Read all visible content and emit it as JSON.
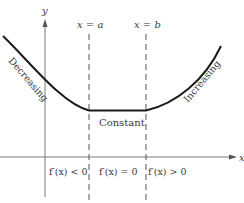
{
  "diagram": {
    "axes": {
      "x_label": "x",
      "y_label": "y"
    },
    "vertical_lines": [
      {
        "label": "x = a"
      },
      {
        "label": "x = b"
      }
    ],
    "curve_labels": {
      "left": "Decreasing",
      "middle": "Constant",
      "right": "Increasing"
    },
    "interval_labels": [
      {
        "text": "f′(x) < 0"
      },
      {
        "text": "f′(x) = 0"
      },
      {
        "text": "f′(x) > 0"
      }
    ],
    "colors": {
      "curve": "#1a1a1a",
      "axes": "#6a6a6a",
      "text": "#3a3a3a"
    }
  }
}
